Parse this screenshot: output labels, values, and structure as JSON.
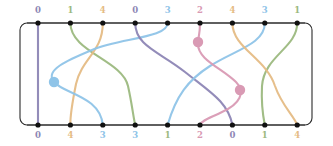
{
  "figure": {
    "type": "braid-diagram",
    "width": 333,
    "height": 146,
    "background": "#ffffff"
  },
  "frame": {
    "x": 20,
    "y": 23,
    "width": 292,
    "height": 102,
    "corner_radius": 7,
    "stroke": "#2b2b2b",
    "stroke_width": 1.1
  },
  "strand_colors": {
    "0": "#8d86b5",
    "1": "#9cb97f",
    "2": "#d99ab4",
    "3": "#8fc4e8",
    "4": "#e5bc85"
  },
  "label_colors": {
    "0": "#8d86b5",
    "1": "#9cb97f",
    "2": "#d99ab4",
    "3": "#8fc4e8",
    "4": "#e5bc85"
  },
  "node": {
    "radius": 2.6,
    "color": "#111111",
    "count_top": 9,
    "count_bottom": 9,
    "first_x": 38,
    "spacing": 32.4,
    "top_y": 23,
    "bottom_y": 125
  },
  "top_labels": [
    {
      "value": "0",
      "color": "#8d86b5",
      "x": 38
    },
    {
      "value": "1",
      "color": "#9cb97f",
      "x": 70.4
    },
    {
      "value": "4",
      "color": "#e5bc85",
      "x": 102.8
    },
    {
      "value": "0",
      "color": "#8d86b5",
      "x": 135.2
    },
    {
      "value": "3",
      "color": "#8fc4e8",
      "x": 167.6
    },
    {
      "value": "2",
      "color": "#d99ab4",
      "x": 200
    },
    {
      "value": "4",
      "color": "#e5bc85",
      "x": 232.4
    },
    {
      "value": "3",
      "color": "#8fc4e8",
      "x": 264.8
    },
    {
      "value": "1",
      "color": "#9cb97f",
      "x": 297.2
    }
  ],
  "bottom_labels": [
    {
      "value": "0",
      "color": "#8d86b5",
      "x": 38
    },
    {
      "value": "4",
      "color": "#e5bc85",
      "x": 70.4
    },
    {
      "value": "3",
      "color": "#8fc4e8",
      "x": 102.8
    },
    {
      "value": "3",
      "color": "#8fc4e8",
      "x": 135.2
    },
    {
      "value": "1",
      "color": "#9cb97f",
      "x": 167.6
    },
    {
      "value": "2",
      "color": "#d99ab4",
      "x": 200
    },
    {
      "value": "0",
      "color": "#8d86b5",
      "x": 232.4
    },
    {
      "value": "1",
      "color": "#9cb97f",
      "x": 264.8
    },
    {
      "value": "4",
      "color": "#e5bc85",
      "x": 297.2
    }
  ],
  "strands": [
    {
      "name": "strand-purple-vertical",
      "color": "#8d86b5",
      "from_top_index": 0,
      "to_bottom_index": 0,
      "path": "M 38 23 L 38 125"
    },
    {
      "name": "strand-green-1",
      "color": "#9cb97f",
      "from_top_index": 1,
      "to_bottom_index": 3,
      "path": "M 70.4 23 C 70.4 52, 122 60, 128 86 C 132 104, 133 115, 135.2 125"
    },
    {
      "name": "strand-tan-1",
      "color": "#e5bc85",
      "from_top_index": 2,
      "to_bottom_index": 1,
      "path": "M 102.8 23 C 102.8 52, 82 58, 76 84 C 72 104, 70 116, 70.4 125"
    },
    {
      "name": "strand-blue-1",
      "color": "#8fc4e8",
      "from_top_index": 4,
      "to_bottom_index": 2,
      "path": "M 167.6 23 C 167.6 38, 120 38, 92 50 C 68 60, 44 70, 54 82 C 64 94, 100 96, 102.8 125"
    },
    {
      "name": "strand-purple-2",
      "color": "#8d86b5",
      "from_top_index": 3,
      "to_bottom_index": 6,
      "path": "M 135.2 23 C 135.2 46, 160 52, 185 72 C 210 92, 228 102, 232.4 125"
    },
    {
      "name": "strand-blue-2",
      "color": "#8fc4e8",
      "from_top_index": 7,
      "to_bottom_index": 4,
      "path": "M 264.8 23 C 264.8 44, 235 50, 210 66 C 188 80, 176 96, 167.6 125"
    },
    {
      "name": "strand-pink-1",
      "color": "#d99ab4",
      "from_top_index": 5,
      "to_bottom_index": 5,
      "path": "M 200 23 C 200 34, 198 38, 198 44 C 198 60, 222 68, 236 82 C 246 92, 240 104, 222 112 C 210 118, 202 120, 200 125"
    },
    {
      "name": "strand-green-2",
      "color": "#9cb97f",
      "from_top_index": 8,
      "to_bottom_index": 7,
      "path": "M 297.2 23 C 297.2 48, 264 56, 262 86 C 261 106, 263 116, 264.8 125"
    },
    {
      "name": "strand-tan-2",
      "color": "#e5bc85",
      "from_top_index": 6,
      "to_bottom_index": 8,
      "path": "M 232.4 23 C 232.4 48, 266 58, 275 86 C 282 106, 294 116, 297.2 125"
    }
  ],
  "markers": [
    {
      "name": "marker-blue",
      "color": "#8fc4e8",
      "x": 54,
      "y": 82,
      "radius": 5.2
    },
    {
      "name": "marker-pink-upper",
      "color": "#d99ab4",
      "x": 198,
      "y": 42,
      "radius": 5.2
    },
    {
      "name": "marker-pink-lower",
      "color": "#d99ab4",
      "x": 240,
      "y": 90,
      "radius": 5.2
    }
  ]
}
